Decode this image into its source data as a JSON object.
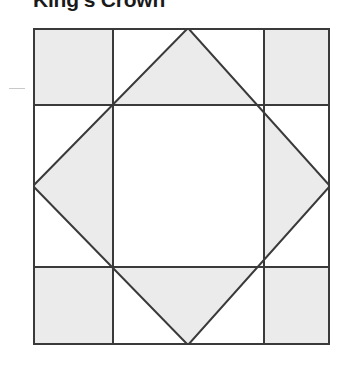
{
  "page": {
    "title": "King's Crown",
    "background_color": "#ffffff"
  },
  "decorations": {
    "left_tick_mark": {
      "name": "tick-mark",
      "color": "#c9c9c9"
    }
  },
  "diagram": {
    "name": "kings-crown-quilt-block",
    "type": "quilt-block-diagram",
    "colors": {
      "shaded_fill": "#ebebeb",
      "background_fill": "#ffffff",
      "line_stroke": "#3a3a3a",
      "border_stroke": "#3a3a3a"
    },
    "geometry": {
      "viewbox_width": 297,
      "viewbox_height": 317,
      "grid_x": [
        0,
        80,
        231,
        297
      ],
      "grid_y": [
        0,
        77,
        239,
        317
      ],
      "midpoints": {
        "top": [
          155,
          0
        ],
        "right": [
          297,
          158
        ],
        "bottom": [
          155,
          317
        ],
        "left": [
          0,
          158
        ]
      }
    },
    "shapes": [
      {
        "name": "corner-square-top-left",
        "fill": "shaded"
      },
      {
        "name": "corner-square-top-right",
        "fill": "shaded"
      },
      {
        "name": "corner-square-bottom-left",
        "fill": "shaded"
      },
      {
        "name": "corner-square-bottom-right",
        "fill": "shaded"
      },
      {
        "name": "on-point-diamond",
        "fill": "shaded"
      },
      {
        "name": "center-square",
        "fill": "background"
      }
    ]
  }
}
